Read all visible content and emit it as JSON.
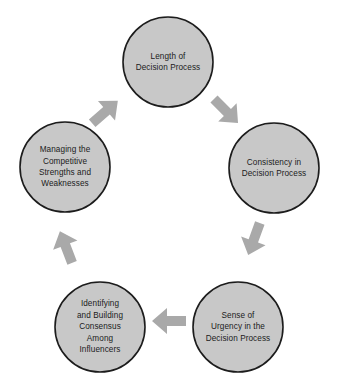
{
  "diagram": {
    "type": "cycle",
    "title": "",
    "background_color": "#ffffff",
    "node_fill_color": "#c8c8c8",
    "node_border_color": "#1c1c1c",
    "arrow_color": "#a9a9a9",
    "text_color": "#1b1b1b",
    "direction": "clockwise",
    "node_count": 5,
    "arrow_count": 5,
    "nodes": [
      {
        "id": "length-of-decision-process",
        "position": "top",
        "lines": [
          "Length of",
          "Decision Process"
        ],
        "text": "Length of Decision Process"
      },
      {
        "id": "consistency-in-decision-process",
        "position": "right",
        "lines": [
          "Consistency in",
          "Decision Process"
        ],
        "text": "Consistency in Decision Process"
      },
      {
        "id": "sense-of-urgency-in-the-decision-process",
        "position": "bottom-right",
        "lines": [
          "Sense of",
          "Urgency in the",
          "Decision Process"
        ],
        "text": "Sense of Urgency in the Decision Process"
      },
      {
        "id": "identifying-and-building-consensus-among-influencers",
        "position": "bottom-left",
        "lines": [
          "Identifying",
          "and Building",
          "Consensus",
          "Among",
          "Influencers"
        ],
        "text": "Identifying and Building Consensus Among Influencers"
      },
      {
        "id": "managing-the-competitive-strengths-and-weaknesses",
        "position": "left",
        "lines": [
          "Managing the",
          "Competitive",
          "Strengths and",
          "Weaknesses"
        ],
        "text": "Managing the Competitive Strengths and Weaknesses"
      }
    ],
    "arrows": [
      {
        "id": "arrow-top-to-right",
        "from": "length-of-decision-process",
        "to": "consistency-in-decision-process",
        "direction": "down-right"
      },
      {
        "id": "arrow-right-to-bottom-right",
        "from": "consistency-in-decision-process",
        "to": "sense-of-urgency-in-the-decision-process",
        "direction": "down-left"
      },
      {
        "id": "arrow-bottom-right-to-bottom-left",
        "from": "sense-of-urgency-in-the-decision-process",
        "to": "identifying-and-building-consensus-among-influencers",
        "direction": "left"
      },
      {
        "id": "arrow-bottom-left-to-left",
        "from": "identifying-and-building-consensus-among-influencers",
        "to": "managing-the-competitive-strengths-and-weaknesses",
        "direction": "up-left"
      },
      {
        "id": "arrow-left-to-top",
        "from": "managing-the-competitive-strengths-and-weaknesses",
        "to": "length-of-decision-process",
        "direction": "up-right"
      }
    ]
  }
}
